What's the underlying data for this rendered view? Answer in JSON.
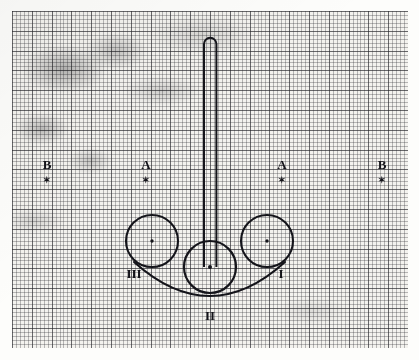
{
  "figure": {
    "kind": "hand-drawn schematic on graph paper",
    "medium": "scanned graph paper (millimetre grid)",
    "sheet": {
      "paper_color": "#f3f2ee",
      "fine_grid_color": "#37373c",
      "heavy_grid_color": "#28282d",
      "fine_grid_step_px": 4,
      "heavy_grid_step_px": 20,
      "ink_color": "#14141a"
    },
    "labels": {
      "top_left_letter": "B",
      "inner_left_letter": "A",
      "inner_right_letter": "A",
      "top_right_letter": "B",
      "marker_glyph": "✶",
      "left_roman": "III",
      "center_roman": "II",
      "right_roman": "I"
    },
    "elements": {
      "stem_name": "vertical elongated loop",
      "left_circle_name": "circle III",
      "center_circle_name": "circle II",
      "right_circle_name": "circle I",
      "arc_name": "connecting arc"
    },
    "geometry": {
      "circle_radius_px": 26,
      "left_circle_center": "152,241",
      "center_circle_center": "210,267",
      "right_circle_center": "267,241",
      "stem_top_y": 36,
      "stem_bottom_y": 267,
      "arc_lowest_y": 296
    }
  }
}
